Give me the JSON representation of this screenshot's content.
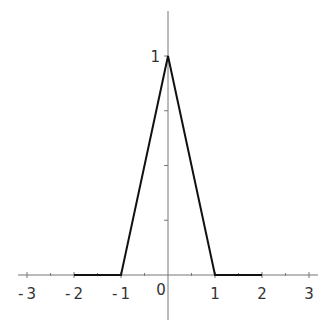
{
  "chart_data": {
    "type": "line",
    "title": "",
    "xlabel": "",
    "ylabel": "",
    "xlim": [
      -3.2,
      3.2
    ],
    "ylim": [
      -0.2,
      1.2
    ],
    "grid": false,
    "legend": null,
    "x_ticks_major": [
      -3,
      -2,
      -1,
      0,
      1,
      2,
      3
    ],
    "x_tick_labels": [
      "-3",
      "-2",
      "-1",
      "0",
      "1",
      "2",
      "3"
    ],
    "x_ticks_minor": [
      -2.5,
      -1.5,
      -0.5,
      0.5,
      1.5,
      2.5
    ],
    "y_ticks": [
      0.25,
      0.5,
      0.75,
      1
    ],
    "y_tick_labels": [
      "",
      "",
      "",
      "1"
    ],
    "series": [
      {
        "name": "triangle function",
        "x": [
          -2,
          -1,
          0,
          1,
          2
        ],
        "y": [
          0,
          0,
          1,
          0,
          0
        ],
        "color": "#111111"
      }
    ]
  },
  "axes": {
    "axis_color": "#777777",
    "origin_label": "0"
  }
}
